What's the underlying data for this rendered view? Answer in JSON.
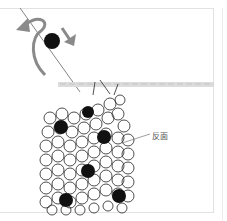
{
  "diagram": {
    "labels": [
      {
        "text": "反面",
        "meaning": "reverse side"
      }
    ],
    "colors": {
      "arrow": "#8a8a8a",
      "bobble": "#111111",
      "yarn_outline": "#222222",
      "hook": "#d0d0d0",
      "frame": "#e2e2e2"
    },
    "elements": {
      "curved_arrow": "curved arrow looping left around bobble",
      "down_arrow": "arrow pointing down-right",
      "hook": "horizontal crochet hook",
      "bobbles_count": 8
    }
  }
}
